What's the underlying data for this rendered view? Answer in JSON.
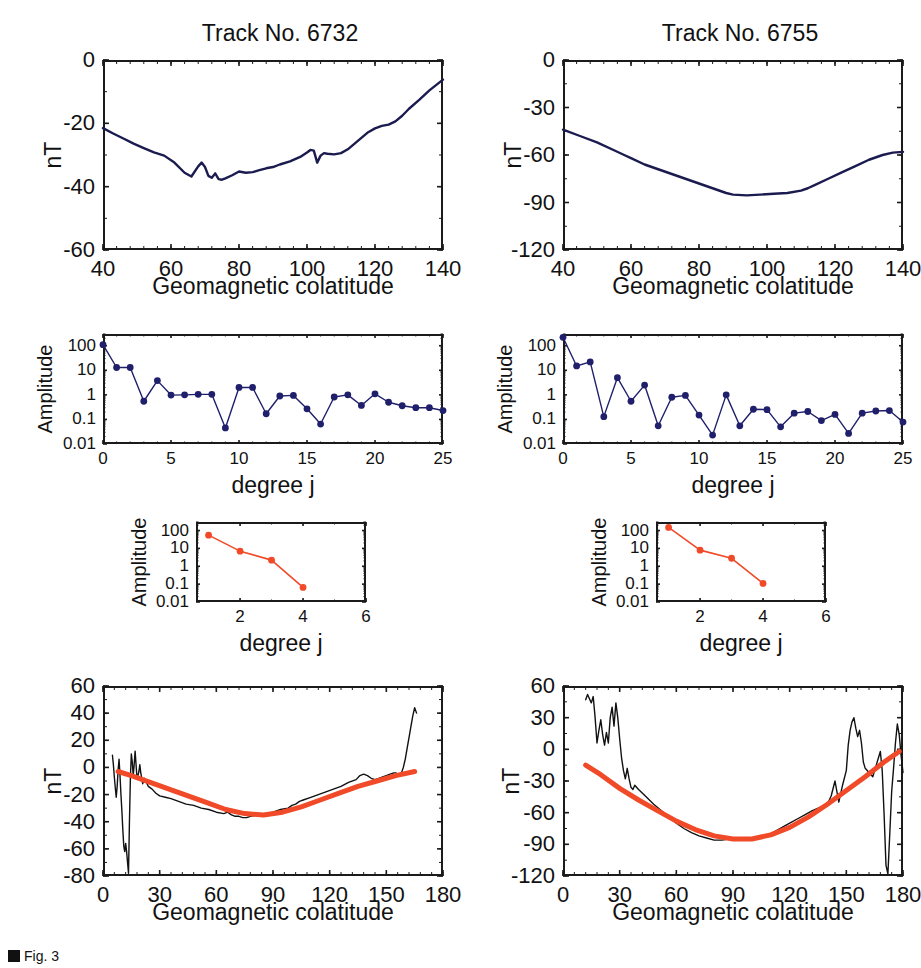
{
  "figure": {
    "caption_label": "Fig. 3",
    "caption_marker": "black-square",
    "colors": {
      "data_curve": "#1b1b4f",
      "fit_curve": "#f04a28",
      "marker_spectrum": "#1f1f6b",
      "marker_inset": "#f04a28",
      "axis": "#1b1b1b"
    }
  },
  "columns": [
    {
      "title": "Track No. 6732"
    },
    {
      "title": "Track No. 6755"
    }
  ],
  "labels": {
    "nt": "nT",
    "amplitude": "Amplitude",
    "geomagnetic_colatitude": "Geomagnetic colatitude",
    "degree_j": "degree j"
  },
  "chart_data": [
    {
      "id": "profile-6732",
      "type": "line",
      "title": "Track No. 6732",
      "xlabel": "Geomagnetic colatitude",
      "ylabel": "nT",
      "xlim": [
        40,
        140
      ],
      "ylim": [
        -60,
        0
      ],
      "xticks": [
        40,
        60,
        80,
        100,
        120,
        140
      ],
      "yticks": [
        0,
        -20,
        -40,
        -60
      ],
      "grid": false,
      "series": [
        {
          "name": "observed field",
          "color": "#1b1b4f",
          "x": [
            40,
            43,
            46,
            49,
            52,
            55,
            58,
            61,
            64,
            66,
            68,
            69,
            70,
            71,
            72,
            73,
            74,
            75,
            76,
            78,
            80,
            82,
            84,
            86,
            88,
            90,
            92,
            95,
            98,
            100,
            101,
            102,
            103,
            104,
            105,
            106,
            108,
            110,
            112,
            114,
            116,
            118,
            120,
            122,
            124,
            126,
            128,
            130,
            133,
            136,
            140
          ],
          "y": [
            -21.5,
            -23.2,
            -24.8,
            -26.4,
            -27.8,
            -29.2,
            -30.2,
            -32.4,
            -35.6,
            -36.8,
            -33.6,
            -32.4,
            -33.8,
            -36.6,
            -37.2,
            -35.8,
            -37.6,
            -37.8,
            -37.4,
            -36.4,
            -35.2,
            -35.6,
            -35.4,
            -34.8,
            -34.2,
            -33.8,
            -33.0,
            -32.0,
            -30.6,
            -29.2,
            -28.4,
            -28.6,
            -32.4,
            -30.2,
            -29.4,
            -29.6,
            -29.8,
            -29.4,
            -28.2,
            -26.4,
            -24.6,
            -22.8,
            -21.6,
            -20.8,
            -20.4,
            -19.4,
            -17.6,
            -15.4,
            -12.6,
            -9.6,
            -6.2
          ]
        }
      ]
    },
    {
      "id": "profile-6755",
      "type": "line",
      "title": "Track No. 6755",
      "xlabel": "Geomagnetic colatitude",
      "ylabel": "nT",
      "xlim": [
        40,
        140
      ],
      "ylim": [
        -120,
        0
      ],
      "xticks": [
        40,
        60,
        80,
        100,
        120,
        140
      ],
      "yticks": [
        0,
        -30,
        -60,
        -90,
        -120
      ],
      "grid": false,
      "series": [
        {
          "name": "observed field",
          "color": "#1b1b4f",
          "x": [
            40,
            45,
            50,
            55,
            58,
            60,
            64,
            68,
            72,
            76,
            80,
            84,
            88,
            90,
            94,
            98,
            102,
            106,
            110,
            112,
            114,
            118,
            122,
            126,
            130,
            134,
            137,
            140
          ],
          "y": [
            -44,
            -48,
            -52,
            -57,
            -60,
            -62,
            -66,
            -69,
            -72,
            -75,
            -78,
            -81,
            -84,
            -85,
            -85.5,
            -85,
            -84.5,
            -84,
            -82.5,
            -81,
            -79,
            -75,
            -71,
            -67,
            -63,
            -60,
            -58.5,
            -58
          ]
        }
      ]
    },
    {
      "id": "spectrum-6732",
      "type": "line",
      "title": "",
      "xlabel": "degree j",
      "ylabel": "Amplitude",
      "xlim": [
        0,
        25
      ],
      "ylim": [
        0.01,
        300
      ],
      "yscale": "log",
      "xticks": [
        0,
        5,
        10,
        15,
        20,
        25
      ],
      "yticks": [
        0.01,
        0.1,
        1,
        10,
        100
      ],
      "marker": "circle",
      "grid": false,
      "series": [
        {
          "name": "spherical harmonic amplitude",
          "color": "#1f1f6b",
          "x": [
            0,
            1,
            2,
            3,
            4,
            5,
            6,
            7,
            8,
            9,
            10,
            11,
            12,
            13,
            14,
            15,
            16,
            17,
            18,
            19,
            20,
            21,
            22,
            23,
            24,
            25
          ],
          "y": [
            110,
            13,
            13,
            0.55,
            3.8,
            0.98,
            1.0,
            1.05,
            1.05,
            0.045,
            2.0,
            2.0,
            0.17,
            0.9,
            0.95,
            0.27,
            0.065,
            0.82,
            1.0,
            0.37,
            1.1,
            0.5,
            0.36,
            0.3,
            0.3,
            0.23
          ]
        }
      ]
    },
    {
      "id": "spectrum-6755",
      "type": "line",
      "title": "",
      "xlabel": "degree j",
      "ylabel": "Amplitude",
      "xlim": [
        0,
        25
      ],
      "ylim": [
        0.01,
        300
      ],
      "yscale": "log",
      "xticks": [
        0,
        5,
        10,
        15,
        20,
        25
      ],
      "yticks": [
        0.01,
        0.1,
        1,
        10,
        100
      ],
      "marker": "circle",
      "grid": false,
      "series": [
        {
          "name": "spherical harmonic amplitude",
          "color": "#1f1f6b",
          "x": [
            0,
            1,
            2,
            3,
            4,
            5,
            6,
            7,
            8,
            9,
            10,
            11,
            12,
            13,
            14,
            15,
            16,
            17,
            18,
            19,
            20,
            21,
            22,
            23,
            24,
            25
          ],
          "y": [
            220,
            15,
            22,
            0.13,
            5.0,
            0.55,
            2.5,
            0.055,
            0.8,
            0.95,
            0.15,
            0.023,
            1.0,
            0.055,
            0.26,
            0.25,
            0.05,
            0.18,
            0.21,
            0.09,
            0.16,
            0.027,
            0.18,
            0.22,
            0.23,
            0.078
          ]
        }
      ]
    },
    {
      "id": "inset-spectrum-6732",
      "type": "line",
      "title": "",
      "xlabel": "degree j",
      "ylabel": "Amplitude",
      "xlim": [
        0.6,
        6
      ],
      "ylim": [
        0.01,
        300
      ],
      "yscale": "log",
      "xticks": [
        2,
        4,
        6
      ],
      "yticks": [
        0.01,
        0.1,
        1,
        10,
        100
      ],
      "marker": "circle",
      "grid": false,
      "series": [
        {
          "name": "fit amplitude",
          "color": "#f04a28",
          "x": [
            1,
            2,
            3,
            4
          ],
          "y": [
            55,
            7.0,
            2.2,
            0.065
          ]
        }
      ]
    },
    {
      "id": "inset-spectrum-6755",
      "type": "line",
      "title": "",
      "xlabel": "degree j",
      "ylabel": "Amplitude",
      "xlim": [
        0.6,
        6
      ],
      "ylim": [
        0.01,
        300
      ],
      "yscale": "log",
      "xticks": [
        2,
        4,
        6
      ],
      "yticks": [
        0.01,
        0.1,
        1,
        10,
        100
      ],
      "marker": "circle",
      "grid": false,
      "series": [
        {
          "name": "fit amplitude",
          "color": "#f04a28",
          "x": [
            1,
            2,
            3,
            4
          ],
          "y": [
            150,
            8.0,
            2.8,
            0.11
          ]
        }
      ]
    },
    {
      "id": "fullprofile-6732",
      "type": "line",
      "title": "",
      "xlabel": "Geomagnetic colatitude",
      "ylabel": "nT",
      "xlim": [
        0,
        180
      ],
      "ylim": [
        -80,
        60
      ],
      "xticks": [
        0,
        30,
        60,
        90,
        120,
        150,
        180
      ],
      "yticks": [
        60,
        40,
        20,
        0,
        -20,
        -40,
        -60,
        -80
      ],
      "grid": false,
      "series": [
        {
          "name": "observed",
          "color": "#111111",
          "x": [
            5,
            5.5,
            6,
            6.5,
            7,
            7.5,
            8,
            8.5,
            9,
            9.5,
            10,
            10.5,
            11,
            11.5,
            12,
            12.5,
            13,
            13.5,
            14,
            14.5,
            15,
            15.5,
            16,
            16.5,
            17,
            17.5,
            18,
            18.5,
            19,
            19.5,
            20,
            21,
            22,
            23,
            24,
            26,
            28,
            30,
            33,
            36,
            40,
            44,
            48,
            52,
            56,
            60,
            64,
            66,
            68,
            70,
            72,
            74,
            76,
            78,
            82,
            86,
            90,
            94,
            98,
            100,
            102,
            104,
            106,
            110,
            114,
            118,
            122,
            126,
            130,
            134,
            136,
            138,
            140,
            142,
            144,
            146,
            148,
            150,
            152,
            154,
            155,
            156,
            157,
            158,
            159,
            160,
            161,
            162,
            163,
            164,
            165,
            166
          ],
          "y": [
            9,
            2,
            -7,
            -15,
            -22,
            -14,
            -2,
            6,
            -6,
            -20,
            -32,
            -46,
            -58,
            -62,
            -56,
            -62,
            -70,
            -78,
            -40,
            -8,
            10,
            4,
            -6,
            2,
            12,
            2,
            -8,
            -6,
            -3,
            2,
            -4,
            -12,
            -8,
            -11,
            -14,
            -16,
            -19,
            -21,
            -22,
            -23,
            -25,
            -27,
            -28,
            -30,
            -31,
            -33,
            -34,
            -33,
            -35,
            -36,
            -36,
            -37,
            -37,
            -36,
            -35,
            -34,
            -33,
            -31,
            -30,
            -28,
            -27,
            -25,
            -24,
            -22,
            -20,
            -18,
            -16,
            -14,
            -11,
            -9,
            -6,
            -5,
            -6,
            -8,
            -9,
            -8,
            -7,
            -6,
            -5,
            -4,
            -4,
            -5,
            -6,
            -4,
            0,
            6,
            14,
            22,
            30,
            38,
            44,
            40,
            34
          ]
        },
        {
          "name": "model fit (degree 1-4)",
          "color": "#f04a28",
          "x": [
            8,
            15,
            25,
            35,
            45,
            55,
            65,
            75,
            85,
            95,
            105,
            115,
            125,
            135,
            145,
            155,
            165
          ],
          "y": [
            -3,
            -6,
            -11,
            -16,
            -21,
            -26,
            -31,
            -34,
            -35,
            -33,
            -29,
            -24,
            -19,
            -14,
            -10,
            -6,
            -3
          ]
        }
      ]
    },
    {
      "id": "fullprofile-6755",
      "type": "line",
      "title": "",
      "xlabel": "Geomagnetic colatitude",
      "ylabel": "nT",
      "xlim": [
        0,
        180
      ],
      "ylim": [
        -120,
        60
      ],
      "xticks": [
        0,
        30,
        60,
        90,
        120,
        150,
        180
      ],
      "yticks": [
        60,
        30,
        0,
        -30,
        -60,
        -90,
        -120
      ],
      "grid": false,
      "series": [
        {
          "name": "observed",
          "color": "#111111",
          "x": [
            12,
            13,
            14,
            15,
            16,
            17,
            18,
            19,
            20,
            21,
            22,
            23,
            24,
            25,
            26,
            27,
            28,
            29,
            30,
            31,
            32,
            33,
            34,
            35,
            36,
            37,
            38,
            40,
            44,
            48,
            52,
            56,
            60,
            64,
            68,
            72,
            76,
            80,
            84,
            88,
            92,
            96,
            100,
            104,
            108,
            112,
            116,
            120,
            124,
            128,
            132,
            136,
            140,
            142,
            144,
            146,
            148,
            150,
            151,
            152,
            153,
            154,
            155,
            156,
            157,
            158,
            159,
            160,
            162,
            164,
            166,
            168,
            169,
            170,
            171,
            172,
            173,
            174,
            175,
            176,
            177,
            178,
            179,
            180
          ],
          "y": [
            47,
            52,
            48,
            44,
            50,
            30,
            6,
            18,
            28,
            14,
            4,
            16,
            6,
            30,
            40,
            22,
            44,
            30,
            10,
            -8,
            -20,
            -28,
            -18,
            -28,
            -36,
            -38,
            -34,
            -38,
            -45,
            -52,
            -58,
            -64,
            -70,
            -75,
            -79,
            -82,
            -84,
            -86,
            -86,
            -85,
            -84,
            -84,
            -85,
            -84,
            -82,
            -78,
            -74,
            -70,
            -66,
            -62,
            -58,
            -55,
            -52,
            -44,
            -30,
            -50,
            -34,
            -20,
            4,
            18,
            26,
            30,
            20,
            12,
            18,
            6,
            -12,
            -18,
            -22,
            -26,
            -14,
            -2,
            -20,
            -62,
            -110,
            -118,
            -80,
            -40,
            -18,
            6,
            24,
            14,
            -6,
            -22
          ]
        },
        {
          "name": "model fit (degree 1-4)",
          "color": "#f04a28",
          "x": [
            12,
            20,
            30,
            40,
            50,
            60,
            70,
            80,
            90,
            100,
            110,
            120,
            130,
            140,
            150,
            160,
            170,
            178
          ],
          "y": [
            -15,
            -24,
            -37,
            -48,
            -58,
            -68,
            -76,
            -82,
            -85,
            -85,
            -81,
            -74,
            -64,
            -52,
            -39,
            -26,
            -12,
            -2
          ]
        }
      ]
    }
  ]
}
